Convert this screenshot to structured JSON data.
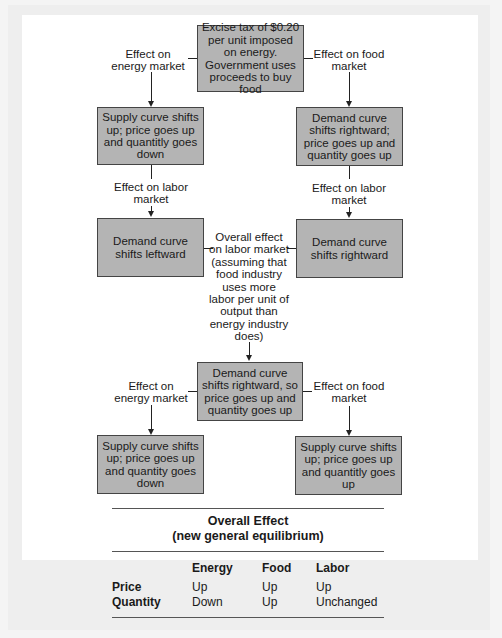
{
  "diagram": {
    "top_box": "Excise tax of $0.20 per unit imposed on energy. Government uses proceeds to buy food",
    "top_left_label": "Effect on energy market",
    "top_right_label": "Effect on food market",
    "row1_left_box": "Supply curve shifts up; price goes up and quantitly goes down",
    "row1_right_box": "Demand curve shifts rightward; price goes up and quantity goes up",
    "row1_left_label": "Effect on labor market",
    "row1_right_label": "Effect on labor market",
    "row2_left_box": "Demand curve shifts leftward",
    "row2_right_box": "Demand curve shifts rightward",
    "center_label": "Overall effect on labor market (assuming that food industry uses more labor per unit of output than energy industry does)",
    "center_box": "Demand curve shifts rightward, so price goes up and quantity goes up",
    "bottom_left_label": "Effect on energy market",
    "bottom_right_label": "Effect on food market",
    "row4_left_box": "Supply curve shifts up; price goes up and quantity goes down",
    "row4_right_box": "Supply curve shifts up; price goes up and quantitly goes up"
  },
  "table": {
    "title_line1": "Overall Effect",
    "title_line2": "(new general equilibrium)",
    "columns": [
      "Energy",
      "Food",
      "Labor"
    ],
    "rows": [
      {
        "label": "Price",
        "values": [
          "Up",
          "Up",
          "Up"
        ]
      },
      {
        "label": "Quantity",
        "values": [
          "Down",
          "Up",
          "Unchanged"
        ]
      }
    ]
  }
}
